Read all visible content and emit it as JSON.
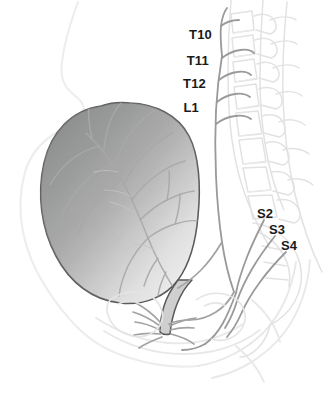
{
  "figure": {
    "background_color": "#ffffff",
    "width": 331,
    "height": 413
  },
  "colors": {
    "label_text": "#1a1a1a",
    "bladder_fill_dark": "#9a9b9b",
    "bladder_fill_light": "#ebebeb",
    "bladder_outline": "#5a5a5a",
    "nerve_line": "#9b9b9b",
    "nerve_line_dark": "#8a8a8a",
    "bone_outline": "#e2e2e4",
    "body_outline": "#ededef",
    "soft_tissue_outline": "#e6e6e8"
  },
  "labels": {
    "spinal_levels": [
      {
        "id": "t10",
        "text": "T10",
        "x": 212,
        "y": 35,
        "align": "right"
      },
      {
        "id": "t11",
        "text": "T11",
        "x": 209,
        "y": 61,
        "align": "right"
      },
      {
        "id": "t12",
        "text": "T12",
        "x": 206,
        "y": 84,
        "align": "right"
      },
      {
        "id": "l1",
        "text": "L1",
        "x": 199,
        "y": 108,
        "align": "right"
      }
    ],
    "sacral_levels": [
      {
        "id": "s2",
        "text": "S2",
        "x": 257,
        "y": 214,
        "align": "left"
      },
      {
        "id": "s3",
        "text": "S3",
        "x": 269,
        "y": 230,
        "align": "left"
      },
      {
        "id": "s4",
        "text": "S4",
        "x": 281,
        "y": 246,
        "align": "left"
      }
    ]
  },
  "structures": {
    "bladder": "urinary-bladder",
    "urethra": "urethra",
    "spine": "vertebral-column",
    "sympathetic_chain": "sympathetic-nerve-chain",
    "sacral_roots": "sacral-nerve-roots",
    "pelvic_plexus": "pelvic-nerve-plexus",
    "body_wall": "anterior-body-wall"
  }
}
